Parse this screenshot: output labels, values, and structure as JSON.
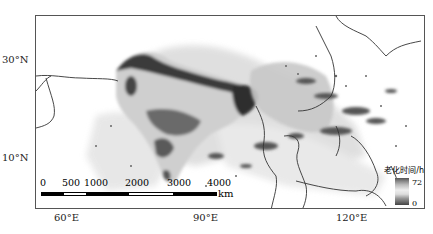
{
  "map": {
    "type": "raster-grayscale",
    "region": "South and Southeast Asia",
    "y_axis": {
      "labels": [
        "30°N",
        "10°N"
      ]
    },
    "x_axis": {
      "labels": [
        "60°E",
        "90°E",
        "120°E"
      ]
    },
    "scale_bar": {
      "ticks": [
        "0",
        "500",
        "1000",
        "2000",
        "3000",
        "4000"
      ],
      "unit": "km"
    },
    "legend": {
      "title": "老化时间/h",
      "max": "72",
      "min": "0"
    },
    "colors": {
      "dark": "#2a2a2a",
      "mid": "#9a9a9a",
      "light": "#d8d8d8",
      "coast": "#333333"
    }
  }
}
